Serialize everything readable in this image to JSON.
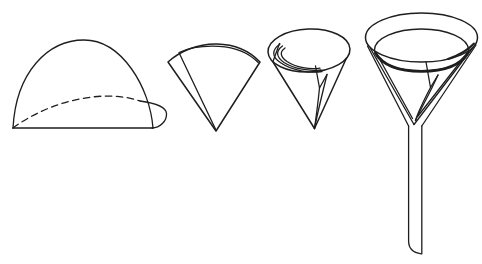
{
  "canvas": {
    "width": 482,
    "height": 264,
    "background": "#ffffff",
    "line_color": "#1e1e1e"
  },
  "diagram": {
    "kind": "line-art illustration",
    "figures": [
      {
        "name": "filter-paper-folded-in-half"
      },
      {
        "name": "filter-paper-folded-into-quarter-cone"
      },
      {
        "name": "filter-paper-opened-into-cone"
      },
      {
        "name": "filter-paper-seated-in-glass-funnel"
      }
    ]
  }
}
